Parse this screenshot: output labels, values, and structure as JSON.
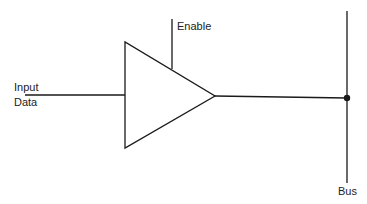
{
  "diagram": {
    "type": "tri-state buffer driving bus",
    "labels": {
      "enable": "Enable",
      "input_line1": "Input",
      "input_line2": "Data",
      "bus": "Bus"
    },
    "colors": {
      "stroke": "#1a1a1a",
      "background": "#ffffff"
    }
  }
}
